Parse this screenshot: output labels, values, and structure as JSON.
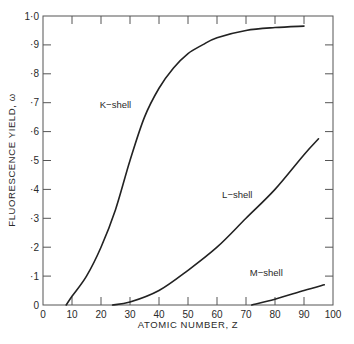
{
  "chart_data": {
    "type": "line",
    "title": "",
    "xlabel": "ATOMIC NUMBER, Z",
    "ylabel": "FLUORESCENCE YIELD, ω",
    "xlim": [
      0,
      100
    ],
    "ylim": [
      0,
      1.0
    ],
    "grid": false,
    "x_ticks": [
      0,
      10,
      20,
      30,
      40,
      50,
      60,
      70,
      80,
      90,
      100
    ],
    "x_tick_labels": [
      "0",
      "10",
      "20",
      "30",
      "40",
      "50",
      "60",
      "70",
      "80",
      "90",
      "100"
    ],
    "y_ticks": [
      0,
      0.1,
      0.2,
      0.3,
      0.4,
      0.5,
      0.6,
      0.7,
      0.8,
      0.9,
      1.0
    ],
    "y_tick_labels": [
      "0",
      "·1",
      "·2",
      "·3",
      "·4",
      "·5",
      "·6",
      "·7",
      "·8",
      "·9",
      "1·0"
    ],
    "series": [
      {
        "name": "K−shell",
        "label": "K−shell",
        "x": [
          8,
          10,
          15,
          20,
          25,
          30,
          35,
          40,
          45,
          50,
          55,
          60,
          70,
          80,
          90
        ],
        "y": [
          0,
          0.03,
          0.1,
          0.2,
          0.33,
          0.5,
          0.65,
          0.75,
          0.82,
          0.87,
          0.9,
          0.925,
          0.95,
          0.96,
          0.965
        ],
        "label_at": [
          25,
          0.68
        ]
      },
      {
        "name": "L−shell",
        "label": "L−shell",
        "x": [
          24,
          30,
          40,
          50,
          60,
          70,
          80,
          90,
          95
        ],
        "y": [
          0,
          0.01,
          0.05,
          0.12,
          0.2,
          0.3,
          0.4,
          0.52,
          0.575
        ],
        "label_at": [
          67,
          0.37
        ]
      },
      {
        "name": "M−shell",
        "label": "M−shell",
        "x": [
          72,
          80,
          90,
          97
        ],
        "y": [
          0,
          0.02,
          0.05,
          0.07
        ],
        "label_at": [
          77,
          0.1
        ]
      }
    ],
    "legend": "none (inline labels)"
  }
}
